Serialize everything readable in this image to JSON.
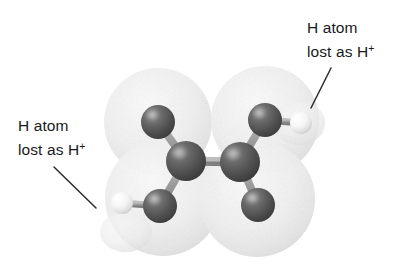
{
  "figure": {
    "kind": "molecular-model",
    "background_color": "#ffffff",
    "annotation_text_color": "#1a1a1a",
    "leader_line_color": "#2b2b2b"
  },
  "annotations": [
    {
      "id": "top-right",
      "line1": "H atom",
      "line2_prefix": "lost as H",
      "line2_sup": "+",
      "leader": {
        "x1": 331,
        "y1": 68,
        "x2": 311,
        "y2": 108
      }
    },
    {
      "id": "left",
      "line1": "H atom",
      "line2_prefix": "lost as H",
      "line2_sup": "+",
      "leader": {
        "x1": 54,
        "y1": 167,
        "x2": 96,
        "y2": 208
      }
    }
  ],
  "molecule": {
    "cloud_color": "#f0f0f0",
    "cloud_edge_color": "#dcdcdc",
    "clouds": [
      {
        "name": "cloud-upper-left",
        "cx": 158,
        "cy": 122,
        "r": 54
      },
      {
        "name": "cloud-upper-right",
        "cx": 265,
        "cy": 120,
        "r": 54
      },
      {
        "name": "cloud-lower-left",
        "cx": 163,
        "cy": 198,
        "r": 58
      },
      {
        "name": "cloud-lower-right",
        "cx": 257,
        "cy": 199,
        "r": 58
      }
    ],
    "bond_color": "#9a9a9a",
    "bond_width": 7,
    "bonds": [
      {
        "name": "bond-c1-o-upper-left",
        "from": "carbon-left",
        "to": "oxygen-upper-left"
      },
      {
        "name": "bond-c1-o-lower-left",
        "from": "carbon-left",
        "to": "oxygen-lower-left"
      },
      {
        "name": "bond-c1-c2",
        "from": "carbon-left",
        "to": "carbon-right"
      },
      {
        "name": "bond-c2-o-upper-right",
        "from": "carbon-right",
        "to": "oxygen-upper-right"
      },
      {
        "name": "bond-c2-o-lower-right",
        "from": "carbon-right",
        "to": "oxygen-lower-right"
      },
      {
        "name": "bond-o-h-left",
        "from": "oxygen-lower-left",
        "to": "hydrogen-left"
      },
      {
        "name": "bond-o-h-right",
        "from": "oxygen-upper-right",
        "to": "hydrogen-right"
      }
    ],
    "atoms": [
      {
        "name": "oxygen-upper-left",
        "element": "O",
        "cx": 158,
        "cy": 122,
        "r": 17,
        "color": "#5e5e5e"
      },
      {
        "name": "carbon-left",
        "element": "C",
        "cx": 186,
        "cy": 161,
        "r": 20,
        "color": "#555555"
      },
      {
        "name": "oxygen-lower-left",
        "element": "O",
        "cx": 160,
        "cy": 206,
        "r": 17,
        "color": "#5e5e5e"
      },
      {
        "name": "hydrogen-left",
        "element": "H",
        "cx": 122,
        "cy": 203,
        "r": 11,
        "color": "#f2f2f2"
      },
      {
        "name": "carbon-right",
        "element": "C",
        "cx": 240,
        "cy": 162,
        "r": 20,
        "color": "#555555"
      },
      {
        "name": "oxygen-upper-right",
        "element": "O",
        "cx": 265,
        "cy": 120,
        "r": 17,
        "color": "#5e5e5e"
      },
      {
        "name": "oxygen-lower-right",
        "element": "O",
        "cx": 258,
        "cy": 205,
        "r": 17,
        "color": "#5e5e5e"
      },
      {
        "name": "hydrogen-right",
        "element": "H",
        "cx": 301,
        "cy": 123,
        "r": 11,
        "color": "#f2f2f2"
      }
    ]
  }
}
